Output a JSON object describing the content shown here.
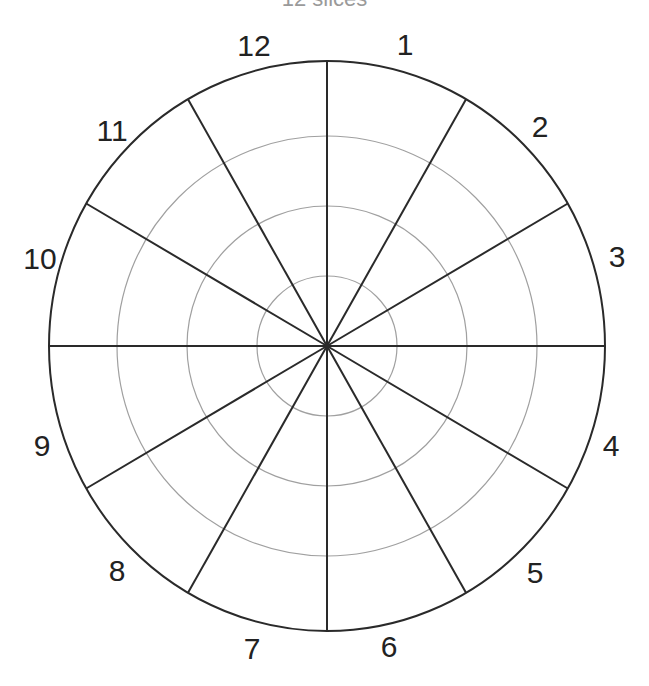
{
  "title": "12 slices",
  "diagram": {
    "type": "polar-grid",
    "center": [
      327,
      346
    ],
    "outer_radius": [
      278,
      285
    ],
    "ring_radii": [
      70,
      140,
      210
    ],
    "spoke_count": 12,
    "colors": {
      "outline": "#2a2a2a",
      "spoke": "#2a2a2a",
      "ring": "#a0a0a0",
      "label": "#222222"
    },
    "labels": [
      {
        "text": "1",
        "x": 405,
        "y": 44
      },
      {
        "text": "2",
        "x": 540,
        "y": 126
      },
      {
        "text": "3",
        "x": 617,
        "y": 256
      },
      {
        "text": "4",
        "x": 611,
        "y": 445
      },
      {
        "text": "5",
        "x": 535,
        "y": 572
      },
      {
        "text": "6",
        "x": 389,
        "y": 646
      },
      {
        "text": "7",
        "x": 252,
        "y": 648
      },
      {
        "text": "8",
        "x": 117,
        "y": 570
      },
      {
        "text": "9",
        "x": 42,
        "y": 445
      },
      {
        "text": "10",
        "x": 40,
        "y": 258
      },
      {
        "text": "11",
        "x": 112,
        "y": 130
      },
      {
        "text": "12",
        "x": 254,
        "y": 45
      }
    ]
  }
}
